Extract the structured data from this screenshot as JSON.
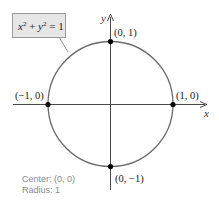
{
  "diagram": {
    "equation_label": {
      "x_term": "x",
      "x_exp": "2",
      "plus": " + ",
      "y_term": "y",
      "y_exp": "2",
      "equals": " = 1"
    },
    "axes": {
      "x_label": "x",
      "y_label": "y"
    },
    "points": [
      {
        "label": "(0, 1)",
        "x": 0,
        "y": 1
      },
      {
        "label": "(−1, 0)",
        "x": -1,
        "y": 0
      },
      {
        "label": "(1, 0)",
        "x": 1,
        "y": 0
      },
      {
        "label": "(0, −1)",
        "x": 0,
        "y": -1
      }
    ],
    "info": {
      "center": "Center: (0, 0)",
      "radius": "Radius: 1"
    },
    "colors": {
      "circle": "#6a6a6a",
      "axes": "#4a4a4a",
      "points": "#000000",
      "label_box_fill": "#e6e6e6",
      "label_box_stroke": "#9a9a9a",
      "info_text": "#8a8a8a",
      "text": "#222222"
    }
  }
}
